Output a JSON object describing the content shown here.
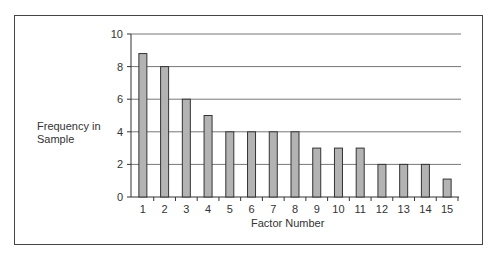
{
  "chart_data": {
    "type": "bar",
    "title": "",
    "xlabel": "Factor Number",
    "ylabel": "Frequency in Sample",
    "ylabel_lines": [
      "Frequency in",
      "Sample"
    ],
    "categories": [
      "1",
      "2",
      "3",
      "4",
      "5",
      "6",
      "7",
      "8",
      "9",
      "10",
      "11",
      "12",
      "13",
      "14",
      "15"
    ],
    "values": [
      8.8,
      8,
      6,
      5,
      4,
      4,
      4,
      4,
      3,
      3,
      3,
      2,
      2,
      2,
      1.1
    ],
    "ylim": [
      0,
      10
    ],
    "yticks": [
      0,
      2,
      4,
      6,
      8,
      10
    ],
    "grid": true,
    "legend": null,
    "bar_color": "#b3b3b3",
    "bar_edge_color": "#333333"
  }
}
